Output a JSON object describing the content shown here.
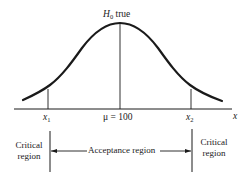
{
  "diagram": {
    "type": "normal-distribution-hypothesis-test",
    "curve_label": {
      "main": "H",
      "subscript": "0",
      "suffix": " true"
    },
    "axis_label": "x",
    "ticks": [
      {
        "id": "x1",
        "main": "x",
        "subscript": "1"
      },
      {
        "id": "mu",
        "text": "μ = 100"
      },
      {
        "id": "x2",
        "main": "x",
        "subscript": "2"
      }
    ],
    "regions": {
      "left": {
        "line1": "Critical",
        "line2": "region"
      },
      "center": "Acceptance region",
      "right": {
        "line1": "Critical",
        "line2": "region"
      }
    },
    "colors": {
      "ink": "#1a1a1a",
      "background": "#ffffff"
    }
  }
}
